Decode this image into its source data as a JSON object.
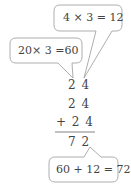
{
  "bubbles": {
    "top": {
      "text": "4 × 3 = 12"
    },
    "left": {
      "text": "20× 3 =60"
    },
    "bottom": {
      "text": "60 + 12 = 72"
    }
  },
  "addition": {
    "rows": [
      "2 4",
      "2 4",
      "+ 2 4"
    ],
    "result": "7 2"
  },
  "colors": {
    "stroke": "#888888",
    "text": "#444444"
  }
}
